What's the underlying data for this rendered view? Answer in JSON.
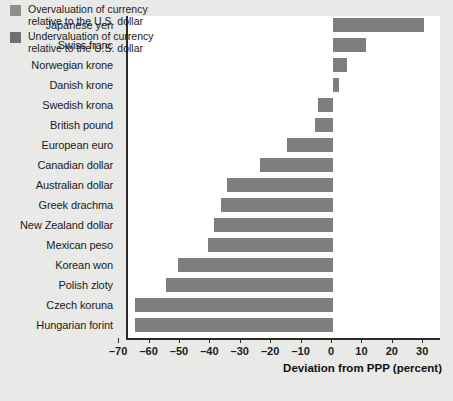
{
  "chart_data": {
    "type": "bar",
    "orientation": "horizontal",
    "title": "",
    "xlabel": "Deviation from PPP (percent)",
    "ylabel": "",
    "xlim": [
      -70,
      33
    ],
    "xticks": [
      "–70",
      "–60",
      "–50",
      "–40",
      "–30",
      "–20",
      "–10",
      "0",
      "10",
      "20",
      "30"
    ],
    "xtick_values": [
      -70,
      -60,
      -50,
      -40,
      -30,
      -20,
      -10,
      0,
      10,
      20,
      30
    ],
    "grid": false,
    "legend_position": "top-left",
    "categories": [
      "Japanese yen",
      "Swiss franc",
      "Norwegian krone",
      "Danish krone",
      "Swedish krona",
      "British pound",
      "European euro",
      "Canadian dollar",
      "Australian dollar",
      "Greek drachma",
      "New Zealand dollar",
      "Mexican peso",
      "Korean won",
      "Polish zloty",
      "Czech koruna",
      "Hungarian forint"
    ],
    "values": [
      30,
      11,
      4.5,
      2,
      -5,
      -6,
      -15,
      -24,
      -35,
      -37,
      -39,
      -41,
      -51,
      -55,
      -65,
      -65
    ],
    "legend": [
      {
        "label_line1": "Overvaluation of currency",
        "label_line2": "relative to the U.S. dollar",
        "color": "#8e8e8e"
      },
      {
        "label_line1": "Undervaluation of currency",
        "label_line2": "relative to the U.S. dollar",
        "color": "#6f6f6f"
      }
    ],
    "bar_color": "#7e7e7e",
    "plot_background": "#ffffff",
    "figure_background": "#e9e9e7",
    "axis_color": "#2b2b2b"
  }
}
